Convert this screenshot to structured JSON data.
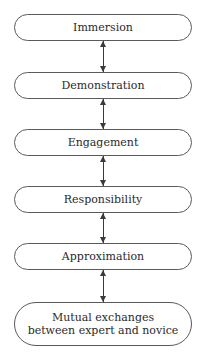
{
  "diagram": {
    "type": "vertical-flow",
    "nodes": [
      {
        "id": "immersion",
        "label": "Immersion"
      },
      {
        "id": "demonstration",
        "label": "Demonstration"
      },
      {
        "id": "engagement",
        "label": "Engagement"
      },
      {
        "id": "responsibility",
        "label": "Responsibility"
      },
      {
        "id": "approximation",
        "label": "Approximation"
      },
      {
        "id": "mutual-exchanges",
        "label": "Mutual exchanges between expert and novice"
      }
    ],
    "edges": [
      {
        "from": "immersion",
        "to": "demonstration",
        "direction": "bidirectional"
      },
      {
        "from": "demonstration",
        "to": "engagement",
        "direction": "bidirectional"
      },
      {
        "from": "engagement",
        "to": "responsibility",
        "direction": "bidirectional"
      },
      {
        "from": "responsibility",
        "to": "approximation",
        "direction": "bidirectional"
      },
      {
        "from": "approximation",
        "to": "mutual-exchanges",
        "direction": "bidirectional"
      }
    ]
  }
}
